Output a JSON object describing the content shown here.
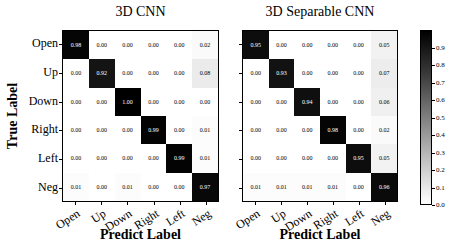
{
  "chart_data": [
    {
      "type": "heatmap",
      "title": "3D CNN",
      "xlabel": "Predict Label",
      "ylabel": "True Label",
      "x_categories": [
        "Open",
        "Up",
        "Down",
        "Right",
        "Left",
        "Neg"
      ],
      "y_categories": [
        "Open",
        "Up",
        "Down",
        "Right",
        "Left",
        "Neg"
      ],
      "rows": [
        [
          0.98,
          0.0,
          0.0,
          0.0,
          0.0,
          0.02
        ],
        [
          0.0,
          0.92,
          0.0,
          0.0,
          0.0,
          0.08
        ],
        [
          0.0,
          0.0,
          1.0,
          0.0,
          0.0,
          0.0
        ],
        [
          0.0,
          0.0,
          0.0,
          0.99,
          0.0,
          0.01
        ],
        [
          0.0,
          0.0,
          0.0,
          0.0,
          0.99,
          0.01
        ],
        [
          0.01,
          0.0,
          0.01,
          0.0,
          0.0,
          0.97
        ]
      ],
      "value_format": "2-decimals",
      "colormap": "grayscale-dark-is-high",
      "value_range": [
        0,
        1
      ],
      "grid": false
    },
    {
      "type": "heatmap",
      "title": "3D Separable CNN",
      "xlabel": "Predict Label",
      "x_categories": [
        "Open",
        "Up",
        "Down",
        "Right",
        "Left",
        "Neg"
      ],
      "y_categories": [
        "Open",
        "Up",
        "Down",
        "Right",
        "Left",
        "Neg"
      ],
      "rows": [
        [
          0.95,
          0.0,
          0.0,
          0.0,
          0.0,
          0.05
        ],
        [
          0.0,
          0.93,
          0.0,
          0.0,
          0.0,
          0.07
        ],
        [
          0.0,
          0.0,
          0.94,
          0.0,
          0.0,
          0.06
        ],
        [
          0.0,
          0.0,
          0.0,
          0.98,
          0.0,
          0.02
        ],
        [
          0.0,
          0.0,
          0.0,
          0.0,
          0.95,
          0.05
        ],
        [
          0.01,
          0.01,
          0.01,
          0.01,
          0.0,
          0.96
        ]
      ],
      "value_format": "2-decimals",
      "colormap": "grayscale-dark-is-high",
      "value_range": [
        0,
        1
      ],
      "grid": false
    }
  ],
  "colorbar": {
    "tick_labels": [
      "0.9",
      "0.8",
      "0.7",
      "0.6",
      "0.5",
      "0.4",
      "0.3",
      "0.2",
      "0.1",
      "0.0"
    ],
    "top_color": "#000000",
    "bottom_color": "#ffffff",
    "position": "right"
  }
}
